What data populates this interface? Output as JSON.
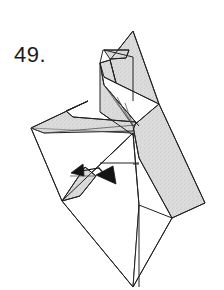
{
  "page": {
    "background_color": "#ffffff",
    "width": 224,
    "height": 290,
    "kind": "origami-folding-diagram"
  },
  "step": {
    "number_label": "49.",
    "number_value": 49
  },
  "figure": {
    "line_color": "#222222",
    "shade_color": "#d9d9d9",
    "white_color": "#ffffff",
    "arrow_color": "#141414",
    "arrow_name": "fold-arrow",
    "description_parts": [
      "head-ear-point",
      "muzzle-point",
      "neck-pleats",
      "foreleg-point",
      "body-shaded-panel",
      "lower-white-panel",
      "small-foot-flap"
    ]
  },
  "shapes": {
    "shaded_panels": [
      {
        "name": "head-upper-shaded",
        "points": "133,31 159,104 116,83 110,60"
      },
      {
        "name": "head-lower-shaded",
        "points": "110,60 116,83 104,77 100,63"
      },
      {
        "name": "ear-shaded",
        "points": "103,50 129,50 126,58 110,59"
      },
      {
        "name": "body-shaded-main",
        "points": "159,104 205,203 172,218 139,158 133,126"
      },
      {
        "name": "neck-shaded",
        "points": "104,85 139,126 133,135 100,112"
      },
      {
        "name": "foreleg-shaded",
        "points": "31,128 88,101 136,122 133,130 44,132"
      },
      {
        "name": "chest-shaded",
        "points": "133,126 139,158 133,133"
      },
      {
        "name": "foot-flap-shaded",
        "points": "62,201 85,167 96,176 80,196"
      }
    ],
    "white_panels": [
      {
        "name": "lower-body-white",
        "points": "62,201 133,133 139,205 133,287"
      },
      {
        "name": "belly-white",
        "points": "31,128 133,133 62,201"
      }
    ],
    "crease_lines": [
      "133,31 159,104",
      "133,31 110,60",
      "110,60 100,63",
      "100,63 103,50",
      "103,50 129,50",
      "129,50 126,58",
      "126,58 110,59",
      "104,50 133,57",
      "133,57 133,100",
      "133,57 159,104",
      "116,83 159,104",
      "104,77 116,83",
      "100,63 104,85",
      "104,85 139,126",
      "104,85 133,126",
      "110,92 133,126",
      "118,97 133,126",
      "126,102 133,126",
      "100,112 133,135",
      "133,126 139,158",
      "139,158 172,218",
      "159,104 205,203",
      "205,203 172,218",
      "172,218 133,287",
      "133,287 62,201",
      "62,201 31,128",
      "31,128 88,101",
      "88,101 136,122",
      "31,128 133,133",
      "133,133 139,205",
      "139,205 139,287",
      "133,133 62,201",
      "88,101 66,111",
      "66,111 73,117",
      "44,132 136,125",
      "85,167 96,176",
      "62,201 85,167",
      "80,196 96,176",
      "62,201 80,196"
    ]
  },
  "arrow": {
    "name": "valley-fold-arrow",
    "shaft": "78,170 100,167 110,176",
    "head_points": "112,165 118,182 97,176",
    "tail_points": "72,173 82,163 86,175"
  }
}
